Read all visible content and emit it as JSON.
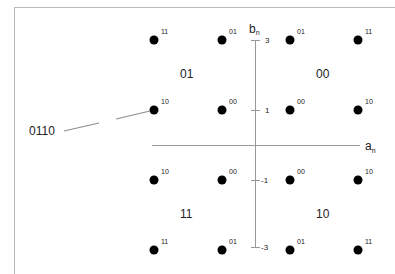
{
  "diagram": {
    "type": "16-QAM Gray-coded constellation",
    "axes": {
      "horizontal_label": "a",
      "horizontal_subscript": "n",
      "vertical_label": "b",
      "vertical_subscript": "n",
      "ticks": [
        {
          "label": "3",
          "value": 3
        },
        {
          "label": "1",
          "value": 1
        },
        {
          "label": "-1",
          "value": -1
        },
        {
          "label": "-3",
          "value": -3
        }
      ]
    },
    "quadrant_labels": {
      "top_left": "01",
      "top_right": "00",
      "bottom_left": "11",
      "bottom_right": "10"
    },
    "points": [
      {
        "a": -3,
        "b": 3,
        "label": "11"
      },
      {
        "a": -1,
        "b": 3,
        "label": "01"
      },
      {
        "a": 1,
        "b": 3,
        "label": "01"
      },
      {
        "a": 3,
        "b": 3,
        "label": "11"
      },
      {
        "a": -3,
        "b": 1,
        "label": "10"
      },
      {
        "a": -1,
        "b": 1,
        "label": "00"
      },
      {
        "a": 1,
        "b": 1,
        "label": "00"
      },
      {
        "a": 3,
        "b": 1,
        "label": "10"
      },
      {
        "a": -3,
        "b": -1,
        "label": "10"
      },
      {
        "a": -1,
        "b": -1,
        "label": "00"
      },
      {
        "a": 1,
        "b": -1,
        "label": "00"
      },
      {
        "a": 3,
        "b": -1,
        "label": "10"
      },
      {
        "a": -3,
        "b": -3,
        "label": "11"
      },
      {
        "a": -1,
        "b": -3,
        "label": "01"
      },
      {
        "a": 1,
        "b": -3,
        "label": "01"
      },
      {
        "a": 3,
        "b": -3,
        "label": "11"
      }
    ],
    "callout": {
      "label": "0110",
      "points_to": {
        "a": -3,
        "b": 1
      }
    }
  }
}
